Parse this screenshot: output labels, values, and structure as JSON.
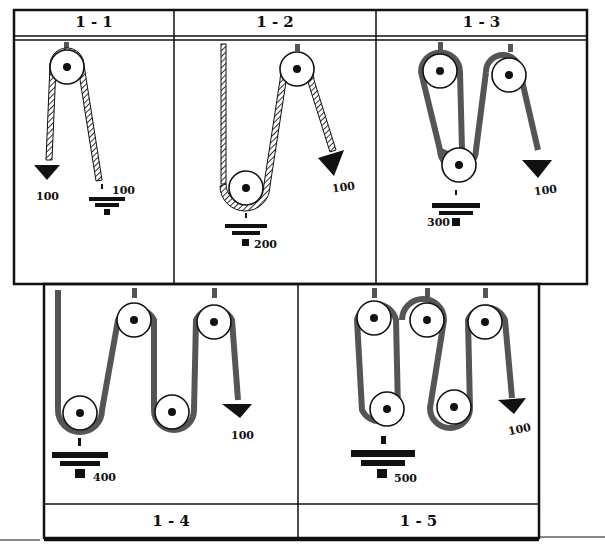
{
  "panels": [
    {
      "id": "1-1",
      "title": "1 - 1",
      "load": "100",
      "effort": "100",
      "moving_pulleys": 0,
      "fixed_pulleys": 1
    },
    {
      "id": "1-2",
      "title": "1 - 2",
      "load": "200",
      "effort": "100",
      "moving_pulleys": 1,
      "fixed_pulleys": 1
    },
    {
      "id": "1-3",
      "title": "1 - 3",
      "load": "300",
      "effort": "100",
      "moving_pulleys": 1,
      "fixed_pulleys": 2
    },
    {
      "id": "1-4",
      "title": "1 - 4",
      "load": "400",
      "effort": "100",
      "moving_pulleys": 2,
      "fixed_pulleys": 2
    },
    {
      "id": "1-5",
      "title": "1 - 5",
      "load": "500",
      "effort": "100",
      "moving_pulleys": 2,
      "fixed_pulleys": 3
    }
  ],
  "colors": {
    "ink": "#111111",
    "rope_hatch": "#555555",
    "background": "#ffffff"
  }
}
